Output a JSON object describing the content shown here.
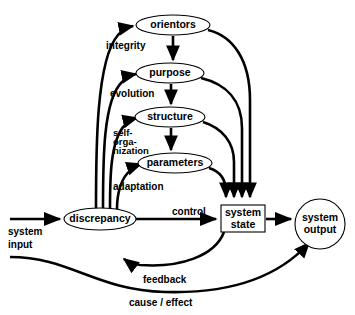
{
  "diagram": {
    "background_color": "#ffffff",
    "stroke_color": "#000000",
    "nodes": [
      {
        "id": "orientors",
        "label": "orientors",
        "shape": "ellipse",
        "cx": 173,
        "cy": 25,
        "rx": 37,
        "ry": 10
      },
      {
        "id": "purpose",
        "label": "purpose",
        "shape": "ellipse",
        "cx": 170,
        "cy": 73,
        "rx": 34,
        "ry": 10
      },
      {
        "id": "structure",
        "label": "structure",
        "shape": "ellipse",
        "cx": 170,
        "cy": 117,
        "rx": 35,
        "ry": 10
      },
      {
        "id": "parameters",
        "label": "parameters",
        "shape": "ellipse",
        "cx": 175,
        "cy": 163,
        "rx": 37,
        "ry": 10
      },
      {
        "id": "discrepancy",
        "label": "discrepancy",
        "shape": "ellipse",
        "cx": 100,
        "cy": 219,
        "rx": 36,
        "ry": 11
      },
      {
        "id": "system_state",
        "label_line1": "system",
        "label_line2": "state",
        "shape": "rect",
        "x": 221,
        "y": 205,
        "w": 44,
        "h": 27
      },
      {
        "id": "system_output",
        "label_line1": "system",
        "label_line2": "output",
        "shape": "circle",
        "cx": 320,
        "cy": 224,
        "r": 25
      }
    ],
    "edge_labels": [
      {
        "id": "integrity",
        "text": "integrity",
        "x": 106,
        "y": 49
      },
      {
        "id": "evolution",
        "text": "evolution",
        "x": 110,
        "y": 97
      },
      {
        "id": "self_org_l1",
        "text": "self-",
        "x": 113,
        "y": 136
      },
      {
        "id": "self_org_l2",
        "text": "orga-",
        "x": 113,
        "y": 145
      },
      {
        "id": "self_org_l3",
        "text": "nization",
        "x": 113,
        "y": 154
      },
      {
        "id": "adaptation",
        "text": "adaptation",
        "x": 113,
        "y": 190
      },
      {
        "id": "control",
        "text": "control",
        "x": 172,
        "y": 215
      },
      {
        "id": "system_input_l1",
        "text": "system",
        "x": 8,
        "y": 235
      },
      {
        "id": "system_input_l2",
        "text": "input",
        "x": 8,
        "y": 248
      },
      {
        "id": "feedback",
        "text": "feedback",
        "x": 143,
        "y": 283
      },
      {
        "id": "cause_effect",
        "text": "cause / effect",
        "x": 129,
        "y": 306
      }
    ],
    "connections": [
      {
        "id": "input-to-discrepancy",
        "from": "system input",
        "to": "discrepancy",
        "type": "straight-arrow"
      },
      {
        "id": "discrepancy-to-state",
        "from": "discrepancy",
        "to": "system state",
        "type": "straight-arrow",
        "label": "control"
      },
      {
        "id": "state-to-output",
        "from": "system state",
        "to": "system output",
        "type": "straight-arrow"
      },
      {
        "id": "discrepancy-to-orientors",
        "from": "discrepancy",
        "to": "orientors",
        "type": "curve-arrow",
        "label": "integrity"
      },
      {
        "id": "discrepancy-to-purpose",
        "from": "discrepancy",
        "to": "purpose",
        "type": "curve-arrow",
        "label": "evolution"
      },
      {
        "id": "discrepancy-to-structure",
        "from": "discrepancy",
        "to": "structure",
        "type": "curve-arrow",
        "label": "self-organization"
      },
      {
        "id": "discrepancy-to-parameters",
        "from": "discrepancy",
        "to": "parameters",
        "type": "curve-arrow",
        "label": "adaptation"
      },
      {
        "id": "orientors-to-purpose",
        "from": "orientors",
        "to": "purpose",
        "type": "straight-arrow"
      },
      {
        "id": "purpose-to-structure",
        "from": "purpose",
        "to": "structure",
        "type": "straight-arrow"
      },
      {
        "id": "structure-to-parameters",
        "from": "structure",
        "to": "parameters",
        "type": "straight-arrow"
      },
      {
        "id": "orientors-to-state",
        "from": "orientors",
        "to": "system state",
        "type": "curve-arrow"
      },
      {
        "id": "purpose-to-state",
        "from": "purpose",
        "to": "system state",
        "type": "curve-arrow"
      },
      {
        "id": "structure-to-state",
        "from": "structure",
        "to": "system state",
        "type": "curve-arrow"
      },
      {
        "id": "parameters-to-state",
        "from": "parameters",
        "to": "system state",
        "type": "curve-arrow"
      },
      {
        "id": "state-to-discrepancy",
        "from": "system state",
        "to": "discrepancy",
        "type": "curve-arrow",
        "label": "feedback"
      },
      {
        "id": "input-to-output",
        "from": "system input",
        "to": "system output",
        "type": "curve-arrow",
        "label": "cause / effect"
      }
    ]
  }
}
